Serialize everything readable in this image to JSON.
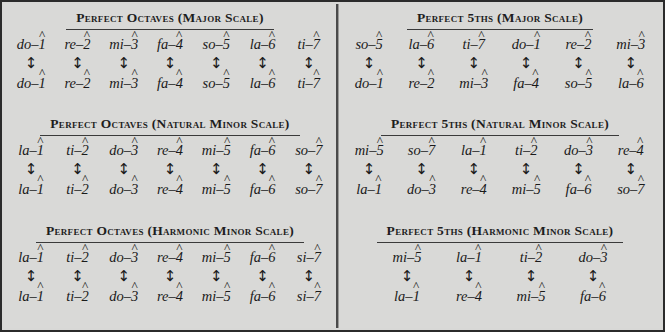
{
  "figure": {
    "background_color": "#d9d9d7",
    "border_color": "#2b2b2b",
    "divider_color": "#4a4a4a",
    "text_color": "#1a1a1a",
    "arrow_glyph": "↕",
    "hat_glyph": "̂",
    "dash_glyph": "–"
  },
  "left_column": {
    "blocks": [
      {
        "heading": "Perfect Octaves (Major Scale)",
        "top_row": [
          {
            "syllable": "do",
            "degree": "1"
          },
          {
            "syllable": "re",
            "degree": "2"
          },
          {
            "syllable": "mi",
            "degree": "3"
          },
          {
            "syllable": "fa",
            "degree": "4"
          },
          {
            "syllable": "so",
            "degree": "5"
          },
          {
            "syllable": "la",
            "degree": "6"
          },
          {
            "syllable": "ti",
            "degree": "7"
          }
        ],
        "bottom_row": [
          {
            "syllable": "do",
            "degree": "1"
          },
          {
            "syllable": "re",
            "degree": "2"
          },
          {
            "syllable": "mi",
            "degree": "3"
          },
          {
            "syllable": "fa",
            "degree": "4"
          },
          {
            "syllable": "so",
            "degree": "5"
          },
          {
            "syllable": "la",
            "degree": "6"
          },
          {
            "syllable": "ti",
            "degree": "7"
          }
        ]
      },
      {
        "heading": "Perfect Octaves (Natural Minor Scale)",
        "top_row": [
          {
            "syllable": "la",
            "degree": "1"
          },
          {
            "syllable": "ti",
            "degree": "2"
          },
          {
            "syllable": "do",
            "degree": "3"
          },
          {
            "syllable": "re",
            "degree": "4"
          },
          {
            "syllable": "mi",
            "degree": "5"
          },
          {
            "syllable": "fa",
            "degree": "6"
          },
          {
            "syllable": "so",
            "degree": "7"
          }
        ],
        "bottom_row": [
          {
            "syllable": "la",
            "degree": "1"
          },
          {
            "syllable": "ti",
            "degree": "2"
          },
          {
            "syllable": "do",
            "degree": "3"
          },
          {
            "syllable": "re",
            "degree": "4"
          },
          {
            "syllable": "mi",
            "degree": "5"
          },
          {
            "syllable": "fa",
            "degree": "6"
          },
          {
            "syllable": "so",
            "degree": "7"
          }
        ]
      },
      {
        "heading": "Perfect Octaves (Harmonic Minor Scale)",
        "top_row": [
          {
            "syllable": "la",
            "degree": "1"
          },
          {
            "syllable": "ti",
            "degree": "2"
          },
          {
            "syllable": "do",
            "degree": "3"
          },
          {
            "syllable": "re",
            "degree": "4"
          },
          {
            "syllable": "mi",
            "degree": "5"
          },
          {
            "syllable": "fa",
            "degree": "6"
          },
          {
            "syllable": "si",
            "degree": "7"
          }
        ],
        "bottom_row": [
          {
            "syllable": "la",
            "degree": "1"
          },
          {
            "syllable": "ti",
            "degree": "2"
          },
          {
            "syllable": "do",
            "degree": "3"
          },
          {
            "syllable": "re",
            "degree": "4"
          },
          {
            "syllable": "mi",
            "degree": "5"
          },
          {
            "syllable": "fa",
            "degree": "6"
          },
          {
            "syllable": "si",
            "degree": "7"
          }
        ]
      }
    ]
  },
  "right_column": {
    "blocks": [
      {
        "heading": "Perfect 5ths (Major Scale)",
        "top_row": [
          {
            "syllable": "so",
            "degree": "5"
          },
          {
            "syllable": "la",
            "degree": "6"
          },
          {
            "syllable": "ti",
            "degree": "7"
          },
          {
            "syllable": "do",
            "degree": "1"
          },
          {
            "syllable": "re",
            "degree": "2"
          },
          {
            "syllable": "mi",
            "degree": "3"
          }
        ],
        "bottom_row": [
          {
            "syllable": "do",
            "degree": "1"
          },
          {
            "syllable": "re",
            "degree": "2"
          },
          {
            "syllable": "mi",
            "degree": "3"
          },
          {
            "syllable": "fa",
            "degree": "4"
          },
          {
            "syllable": "so",
            "degree": "5"
          },
          {
            "syllable": "la",
            "degree": "6"
          }
        ]
      },
      {
        "heading": "Perfect 5ths (Natural Minor Scale)",
        "top_row": [
          {
            "syllable": "mi",
            "degree": "5"
          },
          {
            "syllable": "so",
            "degree": "7"
          },
          {
            "syllable": "la",
            "degree": "1"
          },
          {
            "syllable": "ti",
            "degree": "2"
          },
          {
            "syllable": "do",
            "degree": "3"
          },
          {
            "syllable": "re",
            "degree": "4"
          }
        ],
        "bottom_row": [
          {
            "syllable": "la",
            "degree": "1"
          },
          {
            "syllable": "do",
            "degree": "3"
          },
          {
            "syllable": "re",
            "degree": "4"
          },
          {
            "syllable": "mi",
            "degree": "5"
          },
          {
            "syllable": "fa",
            "degree": "6"
          },
          {
            "syllable": "so",
            "degree": "7"
          }
        ]
      },
      {
        "heading": "Perfect 5ths (Harmonic Minor Scale)",
        "top_row": [
          {
            "syllable": "mi",
            "degree": "5"
          },
          {
            "syllable": "la",
            "degree": "1"
          },
          {
            "syllable": "ti",
            "degree": "2"
          },
          {
            "syllable": "do",
            "degree": "3"
          }
        ],
        "bottom_row": [
          {
            "syllable": "la",
            "degree": "1"
          },
          {
            "syllable": "re",
            "degree": "4"
          },
          {
            "syllable": "mi",
            "degree": "5"
          },
          {
            "syllable": "fa",
            "degree": "6"
          }
        ]
      }
    ]
  }
}
